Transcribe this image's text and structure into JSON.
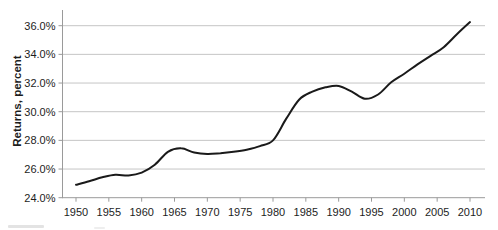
{
  "chart_data": {
    "type": "line",
    "title": "",
    "xlabel": "",
    "ylabel": "Returns, percent",
    "xlim": [
      1950,
      2010
    ],
    "ylim": [
      24,
      37.1
    ],
    "grid": "horizontal",
    "legend": "none",
    "x_tick_values": [
      1950,
      1955,
      1960,
      1965,
      1970,
      1975,
      1980,
      1985,
      1990,
      1995,
      2000,
      2005,
      2010
    ],
    "x_tick_labels": [
      "1950",
      "1955",
      "1960",
      "1965",
      "1970",
      "1975",
      "1980",
      "1985",
      "1990",
      "1995",
      "2000",
      "2005",
      "2010"
    ],
    "y_tick_values": [
      24,
      26,
      28,
      30,
      32,
      34,
      36
    ],
    "y_tick_labels": [
      "24.0%",
      "26.0%",
      "28.0%",
      "30.0%",
      "32.0%",
      "34.0%",
      "36.0%"
    ],
    "series": [
      {
        "name": "Returns",
        "x": [
          1950,
          1952,
          1954,
          1956,
          1958,
          1960,
          1962,
          1964,
          1966,
          1968,
          1970,
          1972,
          1974,
          1976,
          1978,
          1980,
          1982,
          1984,
          1986,
          1988,
          1990,
          1992,
          1994,
          1996,
          1998,
          2000,
          2002,
          2004,
          2006,
          2008,
          2010
        ],
        "y": [
          24.9,
          25.15,
          25.42,
          25.6,
          25.55,
          25.75,
          26.3,
          27.2,
          27.45,
          27.15,
          27.05,
          27.1,
          27.2,
          27.35,
          27.6,
          28.0,
          29.5,
          30.85,
          31.4,
          31.7,
          31.8,
          31.4,
          30.9,
          31.2,
          32.05,
          32.65,
          33.3,
          33.9,
          34.5,
          35.4,
          36.25
        ]
      }
    ],
    "colors": {
      "line": "#1a1a1a",
      "grid": "#c6c6c6",
      "axis": "#9a9a9a",
      "text": "#1d1d1d",
      "background": "#ffffff"
    }
  }
}
